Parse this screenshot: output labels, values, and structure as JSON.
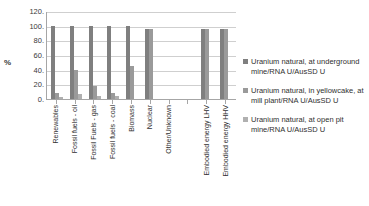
{
  "chart_data": {
    "type": "bar",
    "title": "",
    "xlabel": "",
    "ylabel": "%",
    "ylim": [
      0,
      120
    ],
    "yticks": [
      "120.",
      "100.",
      "80.",
      "60.",
      "40.",
      "20.",
      "0."
    ],
    "ytick_values": [
      120,
      100,
      80,
      60,
      40,
      20,
      0
    ],
    "grid": true,
    "legend_position": "right",
    "categories": [
      "Renewables",
      "Fossil fuels - oil",
      "Fossil Fuels - gas",
      "Fossil fuels - coal",
      "Biomass",
      "Nuclear",
      "Other/Unknown",
      "",
      "Embodied energy LHV",
      "Embodied energy HHV"
    ],
    "series": [
      {
        "name": "Uranium natural, at underground mine/RNA U/AusSD U",
        "color": "#7f7f7f",
        "values": [
          100,
          100,
          100,
          100,
          100,
          95,
          0,
          0,
          95,
          95
        ]
      },
      {
        "name": "Uranium natural, in yellowcake, at mill plant/RNA U/AusSD U",
        "color": "#9a9a9a",
        "values": [
          8,
          40,
          18,
          8,
          45,
          95,
          0,
          0,
          95,
          95
        ]
      },
      {
        "name": "Uranium natural, at open pit mine/RNA U/AusSD U",
        "color": "#b0b0b0",
        "values": [
          3,
          7,
          4,
          4,
          0,
          0,
          0,
          0,
          0,
          0
        ]
      }
    ]
  }
}
